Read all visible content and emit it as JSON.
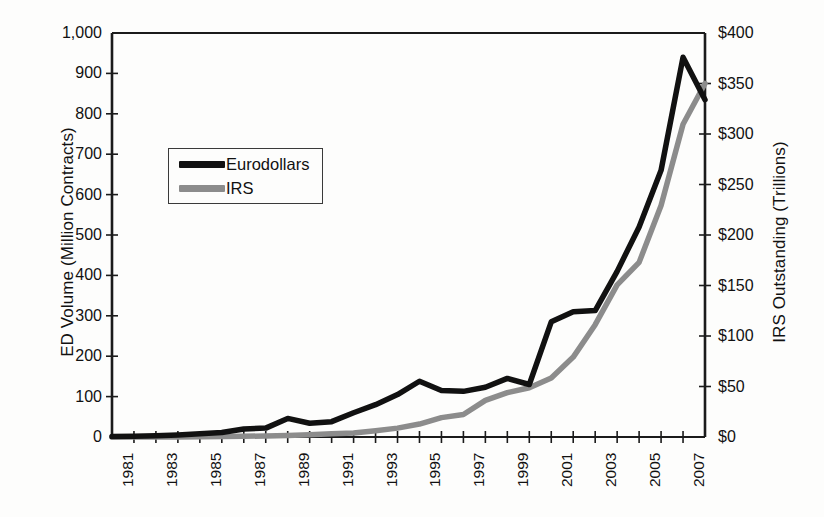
{
  "chart_data": {
    "type": "line",
    "title": "",
    "xlabel": "",
    "ylabel": "ED Volume (Million Contracts)",
    "y2label": "IRS Outstanding (Trillions)",
    "grid": false,
    "legend_position": "upper-left-inside",
    "x": [
      1981,
      1982,
      1983,
      1984,
      1985,
      1986,
      1987,
      1988,
      1989,
      1990,
      1991,
      1992,
      1993,
      1994,
      1995,
      1996,
      1997,
      1998,
      1999,
      2000,
      2001,
      2002,
      2003,
      2004,
      2005,
      2006,
      2007,
      2008
    ],
    "xtick_labels": [
      "1981",
      "1983",
      "1985",
      "1987",
      "1989",
      "1991",
      "1993",
      "1995",
      "1997",
      "1999",
      "2001",
      "2003",
      "2005",
      "2007"
    ],
    "xtick_values": [
      1981,
      1983,
      1985,
      1987,
      1989,
      1991,
      1993,
      1995,
      1997,
      1999,
      2001,
      2003,
      2005,
      2007
    ],
    "xlim": [
      1981,
      2008
    ],
    "ylim": [
      0,
      1000
    ],
    "ytick_labels": [
      "0",
      "100",
      "200",
      "300",
      "400",
      "500",
      "600",
      "700",
      "800",
      "900",
      "1,000"
    ],
    "ytick_values": [
      0,
      100,
      200,
      300,
      400,
      500,
      600,
      700,
      800,
      900,
      1000
    ],
    "y2lim": [
      0,
      400
    ],
    "y2tick_labels": [
      "$0",
      "$50",
      "$100",
      "$150",
      "$200",
      "$250",
      "$300",
      "$350",
      "$400"
    ],
    "y2tick_values": [
      0,
      50,
      100,
      150,
      200,
      250,
      300,
      350,
      400
    ],
    "series": [
      {
        "name": "Eurodollars",
        "axis": "left",
        "color": "#111111",
        "width": 5.5,
        "unit": "Million Contracts",
        "values": [
          1,
          2,
          3,
          5,
          8,
          11,
          20,
          22,
          46,
          34,
          38,
          60,
          80,
          105,
          138,
          115,
          113,
          123,
          145,
          130,
          285,
          310,
          313,
          410,
          520,
          660,
          940,
          835
        ]
      },
      {
        "name": "IRS",
        "axis": "right",
        "color": "#8c8c8c",
        "width": 5.5,
        "unit": "Trillions",
        "values": [
          0,
          0,
          0,
          0.1,
          0.2,
          0.4,
          0.7,
          1.0,
          1.5,
          2.3,
          3.1,
          3.9,
          6.2,
          8.8,
          12.8,
          19.2,
          22.3,
          36.3,
          43.9,
          48.8,
          58.4,
          79.1,
          111.2,
          150.6,
          172.9,
          229.2,
          309.6,
          350.0
        ]
      }
    ]
  },
  "legend": {
    "items": [
      {
        "label": "Eurodollars",
        "color": "#111111"
      },
      {
        "label": "IRS",
        "color": "#8c8c8c"
      }
    ]
  },
  "axes": {
    "left_title": "ED Volume (Million Contracts)",
    "right_title": "IRS Outstanding (Trillions)"
  }
}
